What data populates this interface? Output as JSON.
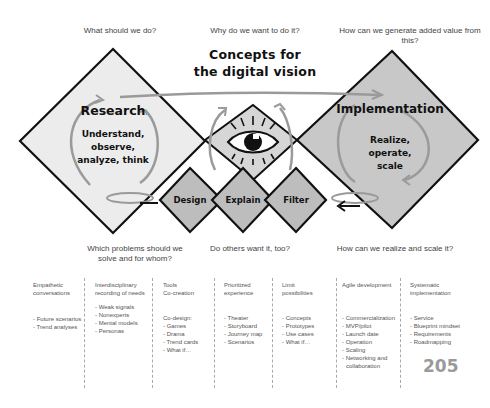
{
  "top_questions": {
    "left": "What should we do?",
    "center": "Why do we want to do it?",
    "right": "How can we generate added value from this?"
  },
  "title": {
    "line1": "Concepts for",
    "line2": "the digital vision"
  },
  "research": {
    "title": "Research",
    "lines": [
      "Understand,",
      "observe,",
      "analyze, think"
    ]
  },
  "implementation": {
    "title": "Implementation",
    "lines": [
      "Realize,",
      "operate,",
      "scale"
    ]
  },
  "steps": [
    "Design",
    "Explain",
    "Filter"
  ],
  "bottom_questions": {
    "left": "Which problems should we solve and for whom?",
    "center": "Do others want it, too?",
    "right": "How can we realize and scale it?"
  },
  "columns": [
    {
      "head": [
        "Empathetic",
        "conversations"
      ],
      "items": [
        "- Future scenarios",
        "- Trend analyses"
      ]
    },
    {
      "head": [
        "Interdisciplinary",
        "recording of needs"
      ],
      "items": [
        "- Weak signals",
        "- Nonexperts",
        "- Mental models",
        "- Personas"
      ]
    },
    {
      "head": [
        "Tools",
        "Co-creation"
      ],
      "items": [
        "Co-design:",
        "- Games",
        "- Drama",
        "- Trend cards",
        "- What if…"
      ]
    },
    {
      "head": [
        "Prioritized",
        "experience"
      ],
      "items": [
        "- Theater",
        "- Storyboard",
        "- Journey map",
        "- Scenarios"
      ]
    },
    {
      "head": [
        "Limit",
        "possibilities"
      ],
      "items": [
        "- Concepts",
        "- Prototypes",
        "- Use cases",
        "- What if…"
      ]
    },
    {
      "head": [
        "Agile development"
      ],
      "items": [
        "- Commercialization",
        "- MVP/pilot",
        "- Launch date",
        "- Operation",
        "- Scaling",
        "- Networking and",
        "  collaboration"
      ]
    },
    {
      "head": [
        "Systematic",
        "implementation"
      ],
      "items": [
        "- Service",
        "- Blueprint mindset",
        "- Requirements",
        "- Roadmapping"
      ]
    }
  ],
  "page_number": "205",
  "colors": {
    "research_fill": "#ececec",
    "implementation_fill": "#c8c8c8",
    "center_fill": "#d6d6d6",
    "step_fill": "#bdbdbd",
    "arrow": "#9a9a9a",
    "outline": "#111111"
  }
}
